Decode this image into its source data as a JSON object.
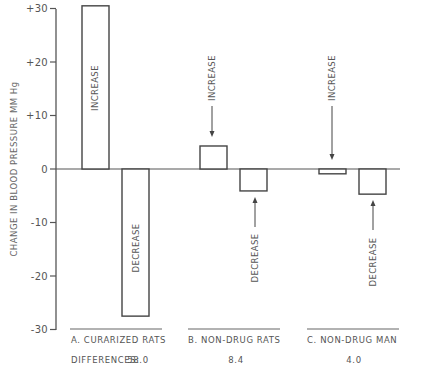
{
  "chart_data": {
    "type": "bar",
    "title": "",
    "ylabel": "CHANGE IN BLOOD PRESSURE   MM Hg",
    "xlabel": "",
    "ylim": [
      -30,
      30
    ],
    "yticks": [
      "+30",
      "+20",
      "+10",
      "0",
      "-10",
      "-20",
      "-30"
    ],
    "ytick_values": [
      30,
      20,
      10,
      0,
      -10,
      -20,
      -30
    ],
    "grid": false,
    "legend": null,
    "categories": [
      "A.  CURARIZED RATS",
      "B.  NON-DRUG RATS",
      "C.  NON-DRUG MAN"
    ],
    "series": [
      {
        "name": "INCREASE",
        "values": [
          30.5,
          4.3,
          -0.9
        ]
      },
      {
        "name": "DECREASE",
        "values": [
          -27.5,
          -4.1,
          -4.7
        ]
      }
    ],
    "annotations": {
      "bar_labels_inside": [
        "INCREASE",
        "DECREASE"
      ],
      "arrow_labels_B": [
        "INCREASE",
        "DECREASE"
      ],
      "arrow_labels_C": [
        "INCREASE",
        "DECREASE"
      ]
    },
    "differences_label": "DIFFERENCES:",
    "differences": [
      "58.0",
      "8.4",
      "4.0"
    ]
  },
  "labels": {
    "increase": "INCREASE",
    "decrease": "DECREASE"
  }
}
